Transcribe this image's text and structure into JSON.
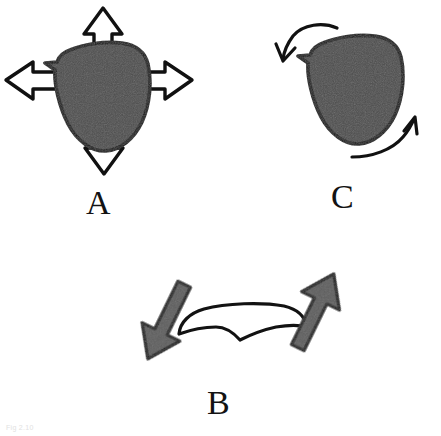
{
  "figure": {
    "width": 441,
    "height": 436,
    "background_color": "#ffffff",
    "caption_faint": "Fig 2.10"
  },
  "colors": {
    "blob_fill": "#4d4d4d",
    "blob_stroke": "#121212",
    "arrow_outline_fill": "#ffffff",
    "arrow_outline_stroke": "#111111",
    "arrow_solid_fill": "#5b5b5b",
    "arrow_solid_stroke": "#111111",
    "curve_stroke": "#111111",
    "label_color": "#131313",
    "caption_color": "#e2e2e2"
  },
  "panels": [
    {
      "id": "a",
      "label": "A",
      "label_x": 86,
      "label_y": 186,
      "mode": "isotropic-expansion",
      "shape": "rounded-triangle",
      "arrow_style": "outline",
      "arrow_count": 4,
      "arrow_directions": [
        "up",
        "left",
        "right",
        "down"
      ]
    },
    {
      "id": "b",
      "label": "B",
      "label_x": 207,
      "label_y": 386,
      "mode": "flattening-shear",
      "shape": "flattened-outline",
      "arrow_style": "solid",
      "arrow_count": 2,
      "arrow_directions": [
        "down-left",
        "up-right"
      ]
    },
    {
      "id": "c",
      "label": "C",
      "label_x": 331,
      "label_y": 180,
      "mode": "rotation",
      "shape": "rounded-triangle",
      "arrow_style": "curved",
      "arrow_count": 2,
      "arrow_directions": [
        "curve-left-top",
        "curve-right-bottom"
      ]
    }
  ]
}
